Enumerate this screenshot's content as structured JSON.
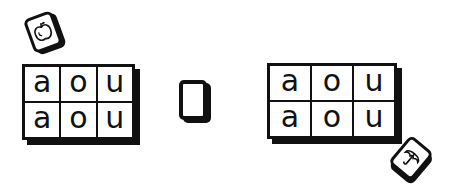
{
  "scene": {
    "description": "Two 2x3 letter grids with picture cards",
    "colors": {
      "ink": "#111111",
      "background": "#ffffff"
    }
  },
  "left_grid": {
    "rows": [
      [
        "a",
        "o",
        "u"
      ],
      [
        "a",
        "o",
        "u"
      ]
    ]
  },
  "right_grid": {
    "rows": [
      [
        "a",
        "o",
        "u"
      ],
      [
        "a",
        "o",
        "u"
      ]
    ]
  },
  "cards": {
    "apple": {
      "icon": "apple-icon"
    },
    "blank": {
      "icon": "none"
    },
    "umbrella": {
      "icon": "umbrella-icon"
    }
  }
}
